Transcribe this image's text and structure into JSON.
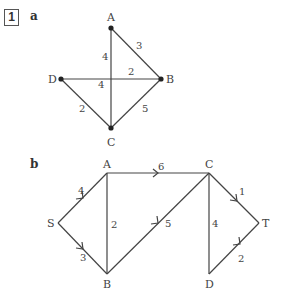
{
  "question_number": "1",
  "parts": [
    {
      "label": "a"
    },
    {
      "label": "b"
    }
  ],
  "graph_a": {
    "type": "undirected",
    "nodes": [
      {
        "id": "A",
        "label": "A"
      },
      {
        "id": "B",
        "label": "B"
      },
      {
        "id": "C",
        "label": "C"
      },
      {
        "id": "D",
        "label": "D"
      }
    ],
    "edges": [
      {
        "from": "A",
        "to": "B",
        "weight": "3"
      },
      {
        "from": "A",
        "to": "C",
        "weight": "4"
      },
      {
        "from": "D",
        "to": "B",
        "weight": "2"
      },
      {
        "from": "D",
        "to": "B",
        "weight_alt": "4",
        "note": "labels 2 and 4 appear on the D–B line either side of the crossing"
      },
      {
        "from": "D",
        "to": "C",
        "weight": "2"
      },
      {
        "from": "B",
        "to": "C",
        "weight": "5"
      }
    ],
    "labels": {
      "A": "A",
      "B": "B",
      "C": "C",
      "D": "D",
      "w_AB": "3",
      "w_AC": "4",
      "w_DB_right": "2",
      "w_DB_left": "4",
      "w_DC": "2",
      "w_BC": "5"
    }
  },
  "graph_b": {
    "type": "directed",
    "nodes": [
      {
        "id": "S",
        "label": "S"
      },
      {
        "id": "A",
        "label": "A"
      },
      {
        "id": "B",
        "label": "B"
      },
      {
        "id": "C",
        "label": "C"
      },
      {
        "id": "D",
        "label": "D"
      },
      {
        "id": "T",
        "label": "T"
      }
    ],
    "edges": [
      {
        "from": "S",
        "to": "A",
        "weight": "4",
        "directed": true
      },
      {
        "from": "S",
        "to": "B",
        "weight": "3",
        "directed": true
      },
      {
        "from": "A",
        "to": "B",
        "weight": "2",
        "directed": false
      },
      {
        "from": "A",
        "to": "C",
        "weight": "6",
        "directed": true
      },
      {
        "from": "B",
        "to": "C",
        "weight": "5",
        "directed": true
      },
      {
        "from": "C",
        "to": "D",
        "weight": "4",
        "directed": false
      },
      {
        "from": "C",
        "to": "T",
        "weight": "1",
        "directed": true
      },
      {
        "from": "D",
        "to": "T",
        "weight": "2",
        "directed": true
      }
    ],
    "labels": {
      "S": "S",
      "A": "A",
      "B": "B",
      "C": "C",
      "D": "D",
      "T": "T",
      "w_SA": "4",
      "w_SB": "3",
      "w_AB": "2",
      "w_AC": "6",
      "w_BC": "5",
      "w_CD": "4",
      "w_CT": "1",
      "w_DT": "2"
    }
  }
}
